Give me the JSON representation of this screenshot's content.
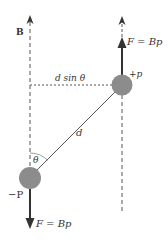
{
  "diagram": {
    "field_label": "B",
    "top_force_label": "F = Bp",
    "bottom_force_label": "F = Bp",
    "positive_charge_label": "+p",
    "negative_charge_label": "−P",
    "separation_label": "d",
    "perpendicular_distance_label": "d sin θ",
    "angle_label": "θ"
  },
  "colors": {
    "charge_fill": "#8c8c8c",
    "line": "#444444",
    "text": "#333333"
  }
}
